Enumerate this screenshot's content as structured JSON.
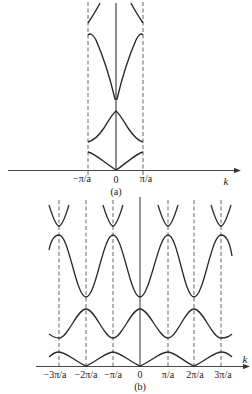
{
  "panel_a": {
    "caption": "(a)",
    "axis_label": "k",
    "tick_labels": [
      "−π/a",
      "0",
      "π/a"
    ],
    "description": "Energy bands in reduced zone scheme, first Brillouin zone between −π/a and π/a"
  },
  "panel_b": {
    "caption": "(b)",
    "axis_label": "k",
    "tick_labels": [
      "−3π/a",
      "−2π/a",
      "−π/a",
      "0",
      "π/a",
      "2π/a",
      "3π/a"
    ],
    "description": "Energy bands in periodic zone scheme"
  },
  "colors": {
    "curve": "#2a2a2a",
    "axis": "#333333",
    "dashed": "#555555",
    "background": "#ffffff"
  }
}
